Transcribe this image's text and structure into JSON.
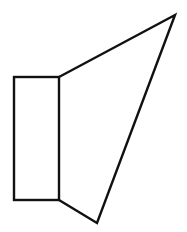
{
  "figure": {
    "width": 187,
    "height": 232,
    "stroke_color": "#111111",
    "background_color": "#ffffff",
    "stroke_width": 2.4,
    "shapes": {
      "box": {
        "x1": 14,
        "y1": 77,
        "x2": 59,
        "y2": 200
      },
      "cone": {
        "points": [
          [
            59,
            77
          ],
          [
            175,
            15
          ],
          [
            97,
            223
          ],
          [
            59,
            200
          ]
        ]
      }
    }
  }
}
